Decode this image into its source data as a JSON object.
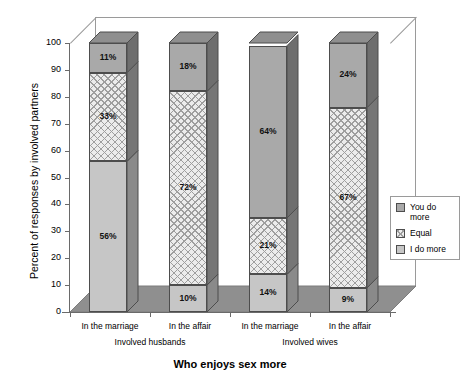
{
  "chart_data": {
    "type": "bar",
    "subtype": "stacked-3d-column",
    "title": "",
    "xlabel": "Who enjoys sex more",
    "ylabel": "Percent of responses by involved partners",
    "ylim": [
      0,
      100
    ],
    "yticks": [
      0,
      10,
      20,
      30,
      40,
      50,
      60,
      70,
      80,
      90,
      100
    ],
    "grid": false,
    "legend_position": "right",
    "categories": [
      "In the marriage",
      "In the affair",
      "In the marriage",
      "In the affair"
    ],
    "groups": [
      {
        "label": "Involved husbands",
        "categories": [
          "In the marriage",
          "In the affair"
        ]
      },
      {
        "label": "Involved wives",
        "categories": [
          "In the marriage",
          "In the affair"
        ]
      }
    ],
    "series": [
      {
        "name": "You do more",
        "color": "#a9a9a9",
        "values": [
          11,
          18,
          64,
          24
        ]
      },
      {
        "name": "Equal",
        "color": "#ececec",
        "values": [
          33,
          72,
          21,
          67
        ]
      },
      {
        "name": "I do more",
        "color": "#c6c6c6",
        "values": [
          56,
          10,
          14,
          9
        ]
      }
    ],
    "bars": [
      {
        "category": "In the marriage",
        "group": "Involved husbands",
        "segments": [
          {
            "series": "I do more",
            "value": 56,
            "label": "56%"
          },
          {
            "series": "Equal",
            "value": 33,
            "label": "33%"
          },
          {
            "series": "You do more",
            "value": 11,
            "label": "11%"
          }
        ]
      },
      {
        "category": "In the affair",
        "group": "Involved husbands",
        "segments": [
          {
            "series": "I do more",
            "value": 10,
            "label": "10%"
          },
          {
            "series": "Equal",
            "value": 72,
            "label": "72%"
          },
          {
            "series": "You do more",
            "value": 18,
            "label": "18%"
          }
        ]
      },
      {
        "category": "In the marriage",
        "group": "Involved wives",
        "segments": [
          {
            "series": "I do more",
            "value": 14,
            "label": "14%"
          },
          {
            "series": "Equal",
            "value": 21,
            "label": "21%"
          },
          {
            "series": "You do more",
            "value": 64,
            "label": "64%"
          }
        ]
      },
      {
        "category": "In the affair",
        "group": "Involved wives",
        "segments": [
          {
            "series": "I do more",
            "value": 9,
            "label": "9%"
          },
          {
            "series": "Equal",
            "value": 67,
            "label": "67%"
          },
          {
            "series": "You do more",
            "value": 24,
            "label": "24%"
          }
        ]
      }
    ]
  },
  "legend": {
    "items": [
      {
        "label": "You do more"
      },
      {
        "label": "Equal"
      },
      {
        "label": "I do more"
      }
    ]
  },
  "axes": {
    "y_title": "Percent of responses by involved partners",
    "x_title": "Who enjoys sex more",
    "y_tick_labels": [
      "100",
      "90",
      "80",
      "70",
      "60",
      "50",
      "40",
      "30",
      "20",
      "10",
      "0"
    ]
  },
  "colors": {
    "you_do_more": "#a9a9a9",
    "equal": "#ececec",
    "i_do_more": "#c6c6c6",
    "floor": "#8f8f8f",
    "side_dark": "#6e6e6e",
    "frame": "#9a9a9a"
  }
}
